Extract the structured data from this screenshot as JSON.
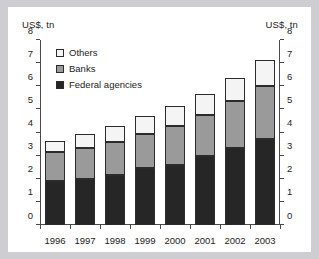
{
  "chart_data": {
    "type": "bar",
    "stacked": true,
    "title": "",
    "xlabel": "",
    "ylabel": "US$, tn",
    "ylabel_right": "US$, tn",
    "ylim": [
      0,
      8
    ],
    "yticks": [
      0,
      1,
      2,
      3,
      4,
      5,
      6,
      7,
      8
    ],
    "ytick_labels": [
      "0",
      "1",
      "2",
      "3",
      "4",
      "5",
      "6",
      "7",
      "8"
    ],
    "grid": false,
    "legend_position": "upper left",
    "categories": [
      "1996",
      "1997",
      "1998",
      "1999",
      "2000",
      "2001",
      "2002",
      "2003"
    ],
    "series": [
      {
        "name": "Federal agencies",
        "color": "#262626",
        "values": [
          1.9,
          2.0,
          2.15,
          2.45,
          2.6,
          3.0,
          3.35,
          3.7
        ]
      },
      {
        "name": "Banks",
        "color": "#9a9a9a",
        "values": [
          1.25,
          1.35,
          1.45,
          1.5,
          1.7,
          1.75,
          2.0,
          2.3
        ]
      },
      {
        "name": "Others",
        "color": "#f4f4f4",
        "values": [
          0.5,
          0.6,
          0.7,
          0.75,
          0.85,
          0.9,
          1.0,
          1.15
        ]
      }
    ],
    "totals": [
      3.65,
      3.95,
      4.3,
      4.7,
      5.15,
      5.65,
      6.35,
      7.15
    ]
  },
  "colors": {
    "page_background": "#cdcdd2",
    "figure_background": "#ffffff",
    "axis": "#4a4a4a",
    "text": "#1c1c1c",
    "federal_agencies": "#262626",
    "banks": "#9a9a9a",
    "others": "#f4f4f4",
    "bar_outline": "#2b2b2b"
  }
}
